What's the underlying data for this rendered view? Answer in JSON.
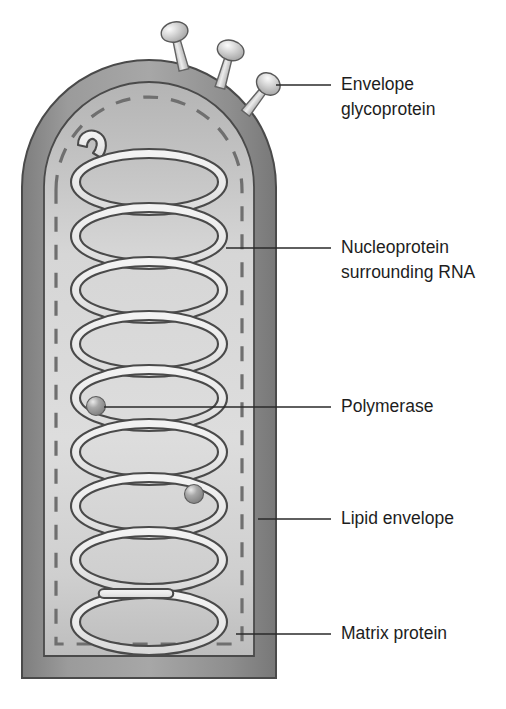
{
  "figure": {
    "background_color": "#ffffff"
  },
  "colors": {
    "background": "#ffffff",
    "envelope_outer": "#8d8d8d",
    "envelope_outer_light": "#a3a3a3",
    "envelope_stroke": "#3f3f3f",
    "matrix_fill": "#b6b6b6",
    "interior_fill": "#dcdcdc",
    "nucleoprotein_fill": "#ebebeb",
    "nucleoprotein_stroke": "#4a4a4a",
    "matrix_dash": "#6d6d6d",
    "spike_head_fill": "#c9c9c9",
    "spike_head_highlight": "#f2f2f2",
    "spike_stalk_fill": "#d4d4d4",
    "polymerase_fill": "#9a9a9a",
    "polymerase_highlight": "#e2e2e2",
    "leader_line": "#2a2a2a",
    "label_text": "#1d1d1d"
  },
  "labels": [
    {
      "id": "envelope-glycoprotein",
      "lines": [
        "Envelope",
        "glycoprotein"
      ],
      "line1": "Envelope",
      "line2": "glycoprotein",
      "text_x": 341,
      "text_y": 85,
      "leader": {
        "x1": 276,
        "y1": 85,
        "x2": 331,
        "y2": 85
      }
    },
    {
      "id": "nucleoprotein-surrounding-rna",
      "lines": [
        "Nucleoprotein",
        "surrounding RNA"
      ],
      "line1": "Nucleoprotein",
      "line2": "surrounding RNA",
      "text_x": 341,
      "text_y": 248,
      "leader": {
        "x1": 226,
        "y1": 248,
        "x2": 331,
        "y2": 248
      }
    },
    {
      "id": "polymerase",
      "lines": [
        "Polymerase"
      ],
      "line1": "Polymerase",
      "line2": "",
      "text_x": 341,
      "text_y": 408,
      "leader": {
        "x1": 104,
        "y1": 408,
        "x2": 331,
        "y2": 408
      }
    },
    {
      "id": "lipid-envelope",
      "lines": [
        "Lipid envelope"
      ],
      "line1": "Lipid envelope",
      "line2": "",
      "text_x": 341,
      "text_y": 519,
      "leader": {
        "x1": 258,
        "y1": 519,
        "x2": 331,
        "y2": 519
      }
    },
    {
      "id": "matrix-protein",
      "lines": [
        "Matrix protein"
      ],
      "line1": "Matrix protein",
      "line2": "",
      "text_x": 341,
      "text_y": 634,
      "leader": {
        "x1": 236,
        "y1": 634,
        "x2": 331,
        "y2": 634
      }
    }
  ],
  "virion": {
    "shape": "bullet",
    "body_left": 22,
    "body_right": 276,
    "body_top": 60,
    "body_bottom": 678,
    "dome_radius": 127,
    "envelope_thickness": 22,
    "matrix_inset": 10,
    "dashed_line_inset": 34
  },
  "glycoprotein_spikes": {
    "count": 3,
    "spikes": [
      {
        "angle_deg": -74,
        "stalk_length": 30,
        "head_rx": 13,
        "head_ry": 10,
        "head_rot": -14
      },
      {
        "angle_deg": -52,
        "stalk_length": 30,
        "head_rx": 13,
        "head_ry": 10,
        "head_rot": 4
      },
      {
        "angle_deg": -28,
        "stalk_length": 28,
        "head_rx": 12,
        "head_ry": 10,
        "head_rot": 22
      }
    ]
  },
  "nucleoprotein_helix": {
    "turn_count": 9,
    "ellipse_rx": 78,
    "ellipse_ry": 33,
    "center_x": 149,
    "first_center_y": 182,
    "turn_pitch": 54,
    "ribbon_width": 9,
    "start_hook": "top-left curl",
    "end_hook": "bottom-left rounded terminus"
  },
  "polymerase_particles": {
    "count": 2,
    "particles": [
      {
        "cx": 96,
        "cy": 406,
        "r": 9
      },
      {
        "cx": 194,
        "cy": 494,
        "r": 9
      }
    ]
  }
}
